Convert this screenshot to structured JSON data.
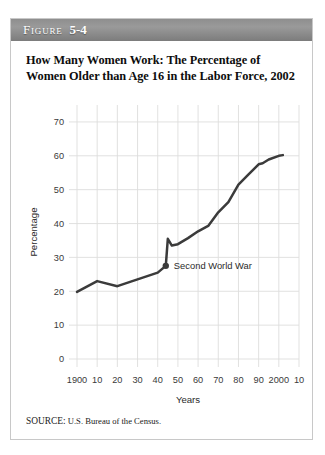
{
  "figure": {
    "label": "Figure",
    "number": "5-4",
    "title": "How Many Women Work: The Percentage of Women Older than Age 16 in the Labor Force, 2002",
    "source_keyword": "SOURCE:",
    "source_text": " U.S. Bureau of the Census."
  },
  "chart_data": {
    "type": "line",
    "title": "How Many Women Work: The Percentage of Women Older than Age 16 in the Labor Force, 2002",
    "xlabel": "Years",
    "ylabel": "Percentage",
    "xlim": [
      1900,
      2010
    ],
    "ylim": [
      0,
      75
    ],
    "grid": true,
    "legend": "none",
    "x_tick_labels": [
      "1900",
      "10",
      "20",
      "30",
      "40",
      "50",
      "60",
      "70",
      "80",
      "90",
      "2000",
      "10"
    ],
    "x_tick_values": [
      1900,
      1910,
      1920,
      1930,
      1940,
      1950,
      1960,
      1970,
      1980,
      1990,
      2000,
      2010
    ],
    "y_tick_labels": [
      "0",
      "10",
      "20",
      "30",
      "40",
      "50",
      "60",
      "70"
    ],
    "y_tick_values": [
      0,
      10,
      20,
      30,
      40,
      50,
      60,
      70
    ],
    "series": [
      {
        "name": "Percentage of women older than age 16 in the labor force",
        "x": [
          1900,
          1910,
          1920,
          1930,
          1940,
          1944,
          1945,
          1947,
          1950,
          1955,
          1960,
          1965,
          1970,
          1975,
          1980,
          1985,
          1990,
          1992,
          1995,
          2000,
          2002
        ],
        "values": [
          19.8,
          23.0,
          21.5,
          23.5,
          25.5,
          27.5,
          35.5,
          33.5,
          33.9,
          35.7,
          37.7,
          39.3,
          43.3,
          46.3,
          51.5,
          54.5,
          57.5,
          57.8,
          58.9,
          60.0,
          60.2
        ]
      }
    ],
    "annotations": [
      {
        "text": "Second World War",
        "x": 1944,
        "y": 27.5,
        "marker": true,
        "marker_shape": "circle"
      }
    ]
  },
  "colors": {
    "line": "#3b3b3b",
    "grid": "#dededd",
    "header_bar": "#8e8e8e",
    "card_border": "#c8c8c8",
    "text": "#0d0d0d"
  }
}
